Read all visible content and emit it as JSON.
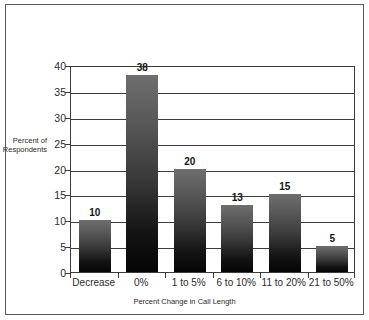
{
  "chart_data": {
    "type": "bar",
    "title": "",
    "subtitle": "",
    "xlabel": "Percent Change in Call Length",
    "ylabel": "Percent of\nRespondents",
    "categories": [
      "Decrease",
      "0%",
      "1 to 5%",
      "6 to 10%",
      "11 to 20%",
      "21 to 50%"
    ],
    "values": [
      10,
      38,
      20,
      13,
      15,
      5
    ],
    "data_labels": [
      "10",
      "38",
      "20",
      "13",
      "15",
      "5"
    ],
    "ylim": [
      0,
      40
    ],
    "ytick_labels": [
      "0",
      "5",
      "10",
      "15",
      "20",
      "25",
      "30",
      "35",
      "40"
    ],
    "ytick_values": [
      0,
      5,
      10,
      15,
      20,
      25,
      30,
      35,
      40
    ],
    "grid": "horizontal",
    "legend": "none",
    "bar_fill": "vertical-gradient-gray-to-black",
    "colors": {
      "bar_top": "#6e6e6e",
      "bar_bottom": "#050505",
      "axis": "#3c3c3c",
      "text": "#2b2b2b",
      "frame": "#555a5e",
      "background": "#ffffff"
    }
  }
}
